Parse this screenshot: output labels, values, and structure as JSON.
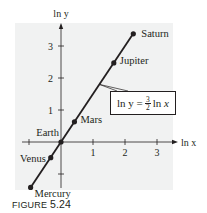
{
  "figure": {
    "caption_prefix": "FIGURE",
    "caption_number": "5.24",
    "background_shade": "#f1f2f2",
    "ink": "#231f20"
  },
  "chart_data": {
    "type": "line",
    "title": "",
    "xlabel": "ln x",
    "ylabel": "ln y",
    "xlim": [
      -1.4,
      3.6
    ],
    "ylim": [
      -1.6,
      3.7
    ],
    "x_ticks": [
      -1,
      1,
      2,
      3
    ],
    "x_tick_labels": [
      "",
      "1",
      "2",
      "3"
    ],
    "y_ticks": [
      -1,
      1,
      2,
      3
    ],
    "y_tick_labels": [
      "",
      "1",
      "2",
      "3"
    ],
    "grid": false,
    "line": {
      "equation": "ln y = (3/2) ln x",
      "slope": 1.5,
      "intercept": 0,
      "x_range": [
        -0.95,
        2.26
      ]
    },
    "points": [
      {
        "name": "Mercury",
        "x": -0.95,
        "y": -1.42
      },
      {
        "name": "Venus",
        "x": -0.32,
        "y": -0.49
      },
      {
        "name": "Earth",
        "x": 0.0,
        "y": 0.0
      },
      {
        "name": "Mars",
        "x": 0.42,
        "y": 0.63
      },
      {
        "name": "Jupiter",
        "x": 1.65,
        "y": 2.47
      },
      {
        "name": "Saturn",
        "x": 2.26,
        "y": 3.38
      }
    ],
    "annotation": {
      "text_lhs": "ln y =",
      "frac_num": "3",
      "frac_den": "2",
      "text_rhs_fn": "ln",
      "text_rhs_var": "x"
    }
  }
}
